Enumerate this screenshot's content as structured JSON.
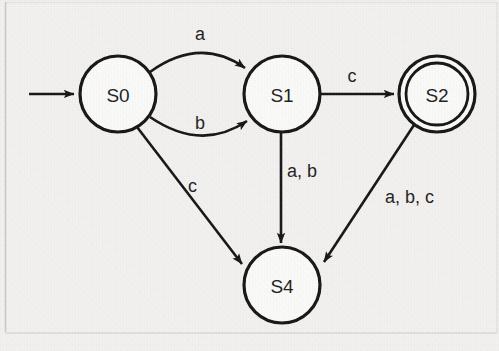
{
  "diagram": {
    "type": "state-transition-diagram",
    "background_color": "#f3f2f0",
    "stroke_color": "#141414",
    "node_fill_color": "#fbfbfa",
    "alphabet": [
      "a",
      "b",
      "c"
    ],
    "start_state": "S0",
    "accept_states": [
      "S2"
    ],
    "states": [
      {
        "id": "S0",
        "label": "S0",
        "cx": 118,
        "cy": 94,
        "r": 38,
        "accepting": false,
        "start": true
      },
      {
        "id": "S1",
        "label": "S1",
        "cx": 282,
        "cy": 94,
        "r": 38,
        "accepting": false,
        "start": false
      },
      {
        "id": "S2",
        "label": "S2",
        "cx": 437,
        "cy": 94,
        "r": 38,
        "accepting": true,
        "start": false
      },
      {
        "id": "S4",
        "label": "S4",
        "cx": 282,
        "cy": 285,
        "r": 38,
        "accepting": false,
        "start": false
      }
    ],
    "transitions": [
      {
        "from": "S0",
        "to": "S1",
        "label": "a",
        "label_x": 200,
        "label_y": 40,
        "shape": "curve-up"
      },
      {
        "from": "S0",
        "to": "S1",
        "label": "b",
        "label_x": 200,
        "label_y": 129,
        "shape": "curve-down"
      },
      {
        "from": "S1",
        "to": "S2",
        "label": "c",
        "label_x": 352,
        "label_y": 82,
        "shape": "straight"
      },
      {
        "from": "S1",
        "to": "S4",
        "label": "a, b",
        "label_x": 287,
        "label_y": 177,
        "shape": "straight"
      },
      {
        "from": "S0",
        "to": "S4",
        "label": "c",
        "label_x": 188,
        "label_y": 192,
        "shape": "straight"
      },
      {
        "from": "S2",
        "to": "S4",
        "label": "a, b, c",
        "label_x": 385,
        "label_y": 203,
        "shape": "straight"
      }
    ],
    "start_arrow": {
      "from_x": 29,
      "to_x": 79,
      "y": 94
    }
  }
}
